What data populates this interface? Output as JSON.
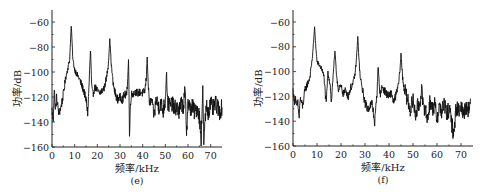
{
  "chart_data": [
    {
      "type": "line",
      "panel_label": "(e)",
      "title": "",
      "xlabel": "频率/kHz",
      "ylabel": "功率/dB",
      "xlim": [
        0,
        75
      ],
      "ylim": [
        -160,
        -50
      ],
      "xticks": [
        0,
        10,
        20,
        30,
        40,
        50,
        60,
        70
      ],
      "yticks": [
        -60,
        -80,
        -100,
        -120,
        -140,
        -160
      ],
      "xtick_labels": [
        "0",
        "10",
        "20",
        "30",
        "40",
        "50",
        "60",
        "70"
      ],
      "ytick_labels": [
        "−60",
        "−80",
        "−100",
        "−120",
        "−140",
        "−160"
      ],
      "grid": false,
      "series": [
        {
          "name": "spectrum-e",
          "x": [
            0,
            0.5,
            1,
            1.5,
            2,
            3,
            4,
            5,
            6,
            7,
            7.8,
            8.5,
            9.2,
            10,
            11,
            12,
            13,
            14,
            15,
            15.8,
            16.3,
            17,
            17.5,
            18,
            19,
            20,
            21,
            22,
            23,
            24,
            24.8,
            25.5,
            26.2,
            27,
            28,
            29,
            30,
            31,
            32,
            33,
            33.8,
            34.2,
            34.6,
            35,
            36,
            37,
            38,
            39,
            40,
            41,
            41.6,
            42,
            42.5,
            43,
            44,
            45,
            46,
            47,
            48,
            49,
            50,
            50.5,
            51,
            52,
            53,
            54,
            55,
            56,
            57,
            58,
            58.7,
            59.3,
            60,
            61,
            62,
            63,
            64,
            65,
            65.8,
            66.5,
            67,
            68,
            69,
            70,
            71,
            72,
            73,
            74,
            75
          ],
          "y": [
            -130,
            -140,
            -113,
            -132,
            -120,
            -133,
            -128,
            -118,
            -105,
            -97,
            -90,
            -62,
            -90,
            -98,
            -102,
            -105,
            -110,
            -115,
            -122,
            -133,
            -112,
            -81,
            -112,
            -118,
            -112,
            -115,
            -117,
            -115,
            -113,
            -105,
            -95,
            -74,
            -95,
            -110,
            -118,
            -122,
            -120,
            -122,
            -118,
            -119,
            -89,
            -154,
            -125,
            -118,
            -117,
            -116,
            -117,
            -116,
            -117,
            -115,
            -105,
            -87,
            -112,
            -125,
            -122,
            -135,
            -122,
            -128,
            -125,
            -131,
            -123,
            -98,
            -125,
            -127,
            -125,
            -130,
            -127,
            -133,
            -125,
            -128,
            -113,
            -148,
            -125,
            -130,
            -127,
            -133,
            -128,
            -135,
            -155,
            -112,
            -157,
            -127,
            -132,
            -125,
            -130,
            -125,
            -128,
            -132,
            -128
          ]
        }
      ]
    },
    {
      "type": "line",
      "panel_label": "(f)",
      "title": "",
      "xlabel": "频率/kHz",
      "ylabel": "功率/dB",
      "xlim": [
        0,
        75
      ],
      "ylim": [
        -160,
        -50
      ],
      "xticks": [
        0,
        10,
        20,
        30,
        40,
        50,
        60,
        70
      ],
      "yticks": [
        -60,
        -80,
        -100,
        -120,
        -140,
        -160
      ],
      "xtick_labels": [
        "0",
        "10",
        "20",
        "30",
        "40",
        "50",
        "60",
        "70"
      ],
      "ytick_labels": [
        "−60",
        "−80",
        "−100",
        "−120",
        "−140",
        "−160"
      ],
      "grid": false,
      "series": [
        {
          "name": "spectrum-f",
          "x": [
            0,
            0.5,
            1,
            1.5,
            2,
            2.5,
            3,
            4,
            5,
            6,
            7,
            8,
            8.5,
            9,
            9.5,
            10,
            11,
            12,
            13,
            13.8,
            14.5,
            15,
            15.5,
            16,
            16.8,
            17.5,
            18,
            18.5,
            19,
            20,
            21,
            22,
            23,
            24,
            25,
            26,
            26.5,
            27,
            27.5,
            28,
            29,
            30,
            31,
            32,
            33,
            34,
            35,
            35.5,
            36,
            36.5,
            37,
            38,
            39,
            40,
            41,
            42,
            43,
            44,
            44.5,
            45,
            45.5,
            46,
            47,
            48,
            49,
            50,
            51,
            52,
            53,
            53.6,
            54.2,
            55,
            56,
            57,
            58,
            59,
            60,
            61,
            62,
            63,
            64,
            65,
            66,
            67,
            68,
            69,
            70,
            71,
            72,
            73,
            74,
            75
          ],
          "y": [
            -115,
            -125,
            -120,
            -130,
            -125,
            -138,
            -122,
            -128,
            -115,
            -110,
            -105,
            -90,
            -78,
            -64,
            -80,
            -92,
            -95,
            -98,
            -105,
            -128,
            -101,
            -105,
            -110,
            -126,
            -100,
            -84,
            -100,
            -108,
            -115,
            -112,
            -118,
            -115,
            -120,
            -113,
            -110,
            -100,
            -88,
            -72,
            -90,
            -105,
            -115,
            -125,
            -130,
            -128,
            -125,
            -142,
            -118,
            -93,
            -115,
            -118,
            -112,
            -115,
            -118,
            -120,
            -117,
            -125,
            -118,
            -110,
            -100,
            -86,
            -100,
            -110,
            -118,
            -125,
            -130,
            -123,
            -135,
            -128,
            -125,
            -112,
            -130,
            -128,
            -140,
            -125,
            -130,
            -127,
            -138,
            -128,
            -132,
            -125,
            -135,
            -130,
            -140,
            -151,
            -128,
            -132,
            -127,
            -135,
            -128,
            -130,
            -128
          ]
        }
      ]
    }
  ]
}
